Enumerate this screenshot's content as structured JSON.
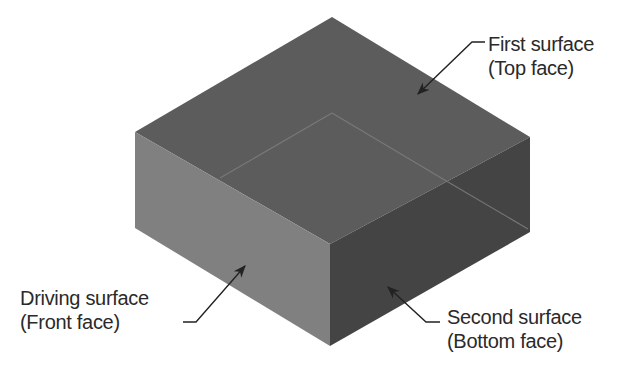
{
  "figure": {
    "type": "isometric-box-diagram",
    "colors": {
      "background": "#ffffff",
      "top_face": "#5c5c5c",
      "front_face": "#808080",
      "right_face": "#444444",
      "hidden_edge": "#7a7a7a",
      "arrow": "#222222",
      "text": "#2a2a2a"
    }
  },
  "labels": {
    "first_surface": {
      "line1": "First surface",
      "line2": "(Top face)"
    },
    "driving_surface": {
      "line1": "Driving surface",
      "line2": "(Front face)"
    },
    "second_surface": {
      "line1": "Second surface",
      "line2": "(Bottom face)"
    }
  }
}
